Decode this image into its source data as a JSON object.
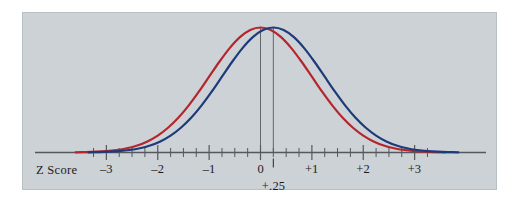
{
  "figure": {
    "name": "z-score-normal-distribution-figure",
    "background_color": "#ffffff",
    "panel_color": "#ccd2d6",
    "panel_border_color": "#b9c0c4"
  },
  "axis_title": "Z Score",
  "annotation": {
    "label": "+.25",
    "z_value": 0.25
  },
  "chart_data": {
    "type": "line",
    "title": "",
    "subtitle": "",
    "xlabel": "Z Score",
    "ylabel": "",
    "xlim": [
      -4.0,
      4.0
    ],
    "ylim": [
      0,
      1.06
    ],
    "grid": false,
    "legend_position": "none",
    "x_ticks_major": [
      -3,
      -2,
      -1,
      0,
      1,
      2,
      3
    ],
    "x_tick_labels": [
      "–3",
      "–2",
      "–1",
      "0",
      "+1",
      "+2",
      "+3"
    ],
    "x_tick_minor_step": 0.25,
    "x_minor_range": [
      -3.25,
      3.25
    ],
    "annotations": [
      {
        "label": "+.25",
        "x": 0.25,
        "type": "axis-marker-tick"
      }
    ],
    "series": [
      {
        "name": "red-distribution",
        "color": "#b4262e",
        "mean": 0.0,
        "sd": 1.0,
        "peak_value": 1.0,
        "linewidth": 2.2,
        "drop_line": true,
        "x": [
          -3.6,
          -3.4,
          -3.2,
          -3.0,
          -2.8,
          -2.6,
          -2.4,
          -2.2,
          -2.0,
          -1.8,
          -1.6,
          -1.4,
          -1.2,
          -1.0,
          -0.8,
          -0.6,
          -0.4,
          -0.2,
          0.0,
          0.2,
          0.4,
          0.6,
          0.8,
          1.0,
          1.2,
          1.4,
          1.6,
          1.8,
          2.0,
          2.2,
          2.4,
          2.6,
          2.8,
          3.0,
          3.2,
          3.4,
          3.6
        ],
        "y": [
          0.0015,
          0.0032,
          0.0063,
          0.0111,
          0.0198,
          0.034,
          0.0561,
          0.0889,
          0.1353,
          0.1979,
          0.278,
          0.3753,
          0.4868,
          0.6065,
          0.7261,
          0.8353,
          0.9231,
          0.9802,
          1.0,
          0.9802,
          0.9231,
          0.8353,
          0.7261,
          0.6065,
          0.4868,
          0.3753,
          0.278,
          0.1979,
          0.1353,
          0.0889,
          0.0561,
          0.034,
          0.0198,
          0.0111,
          0.0063,
          0.0032,
          0.0015
        ]
      },
      {
        "name": "blue-distribution",
        "color": "#1e3a7a",
        "mean": 0.25,
        "sd": 1.0,
        "peak_value": 1.0,
        "linewidth": 2.2,
        "drop_line": true,
        "x": [
          -3.35,
          -3.15,
          -2.95,
          -2.75,
          -2.55,
          -2.35,
          -2.15,
          -1.95,
          -1.75,
          -1.55,
          -1.35,
          -1.15,
          -0.95,
          -0.75,
          -0.55,
          -0.35,
          -0.15,
          0.05,
          0.25,
          0.45,
          0.65,
          0.85,
          1.05,
          1.25,
          1.45,
          1.65,
          1.85,
          2.05,
          2.25,
          2.45,
          2.65,
          2.85,
          3.05,
          3.25,
          3.45,
          3.65,
          3.85
        ],
        "y": [
          0.0015,
          0.0032,
          0.0063,
          0.0111,
          0.0198,
          0.034,
          0.0561,
          0.0889,
          0.1353,
          0.1979,
          0.278,
          0.3753,
          0.4868,
          0.6065,
          0.7261,
          0.8353,
          0.9231,
          0.9802,
          1.0,
          0.9802,
          0.9231,
          0.8353,
          0.7261,
          0.6065,
          0.4868,
          0.3753,
          0.278,
          0.1979,
          0.1353,
          0.0889,
          0.0561,
          0.034,
          0.0198,
          0.0111,
          0.0063,
          0.0032,
          0.0015
        ]
      }
    ]
  }
}
